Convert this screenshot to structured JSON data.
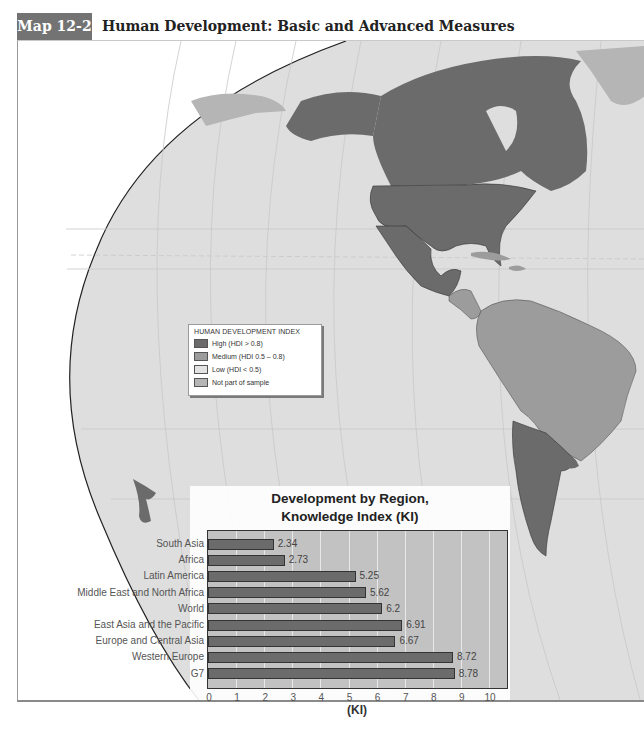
{
  "header": {
    "map_tag": "Map 12-2",
    "title": "Human Development: Basic and Advanced Measures"
  },
  "legend": {
    "title": "HUMAN DEVELOPMENT INDEX",
    "items": [
      {
        "label": "High (HDI > 0.8)",
        "color": "#6b6b6b"
      },
      {
        "label": "Medium (HDI 0.5 – 0.8)",
        "color": "#9c9c9c"
      },
      {
        "label": "Low (HDI < 0.5)",
        "color": "#e2e2e2"
      },
      {
        "label": "Not part of sample",
        "color": "#b5b5b5"
      }
    ]
  },
  "colors": {
    "ocean": "#dedede",
    "high": "#6b6b6b",
    "medium": "#9c9c9c",
    "not_sampled": "#b5b5b5",
    "bar": "#6b6b6b",
    "plot_bg": "#c2c2c2",
    "header_tag": "#737373"
  },
  "chart_data": {
    "type": "bar",
    "orientation": "horizontal",
    "title": "Development by Region, Knowledge Index (KI)",
    "title_line1": "Development by Region,",
    "title_line2": "Knowledge Index (KI)",
    "xlabel": "(KI)",
    "ylabel": "",
    "xlim": [
      0,
      10
    ],
    "xticks": [
      "0",
      "1",
      "2",
      "3",
      "4",
      "5",
      "6",
      "7",
      "8",
      "9",
      "10"
    ],
    "grid": true,
    "categories": [
      "South Asia",
      "Africa",
      "Latin America",
      "Middle East and North Africa",
      "World",
      "East Asia and the Pacific",
      "Europe and Central Asia",
      "Western Europe",
      "G7"
    ],
    "values": [
      2.34,
      2.73,
      5.25,
      5.62,
      6.2,
      6.91,
      6.67,
      8.72,
      8.78
    ],
    "value_labels": [
      "2.34",
      "2.73",
      "5.25",
      "5.62",
      "6.2",
      "6.91",
      "6.67",
      "8.72",
      "8.78"
    ]
  }
}
